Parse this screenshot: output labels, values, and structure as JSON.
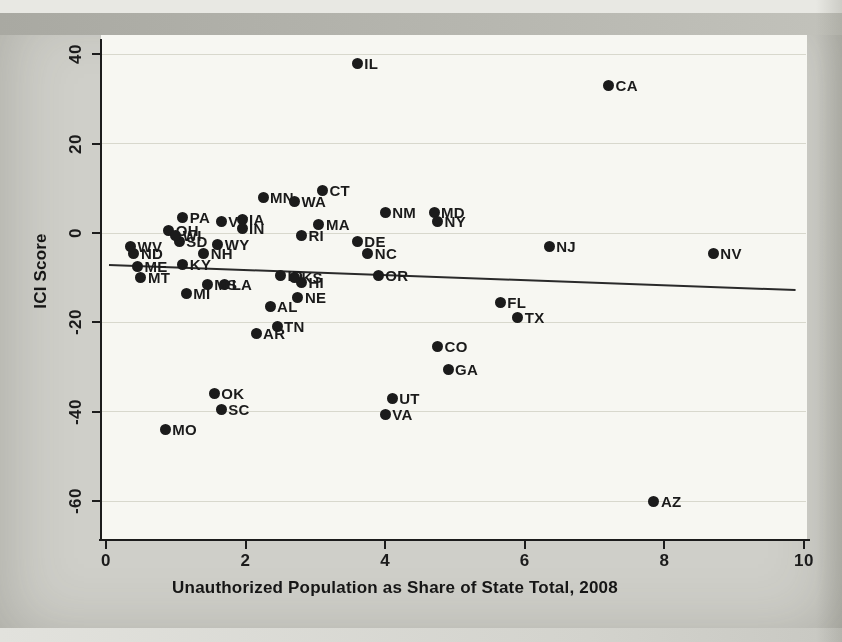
{
  "figure": {
    "kind": "photographed scatter plot figure",
    "title": "",
    "ink_color": "#1b1b1b",
    "page_color": "#cfcfc9",
    "plot_bg_color": "#f7f7f2",
    "gridline_color": "#d8d8cd"
  },
  "chart_data": {
    "type": "scatter",
    "title": "",
    "xlabel": "Unauthorized Population as Share of State Total, 2008",
    "ylabel": "ICI Score",
    "xlim": [
      0,
      10
    ],
    "ylim": [
      -68,
      44
    ],
    "x_ticks": [
      0,
      2,
      4,
      6,
      8,
      10
    ],
    "y_ticks": [
      40,
      20,
      0,
      -20,
      -40,
      -60
    ],
    "grid": "horizontal",
    "legend": "none",
    "marker": "filled-circle",
    "label_position": "right-of-marker",
    "trend_line": {
      "x1": 0,
      "y1": -7.2,
      "x2": 10,
      "y2": -12.8
    },
    "points": [
      {
        "label": "AL",
        "x": 2.35,
        "y": -16.5
      },
      {
        "label": "AR",
        "x": 2.15,
        "y": -22.5
      },
      {
        "label": "AZ",
        "x": 7.85,
        "y": -60
      },
      {
        "label": "CA",
        "x": 7.2,
        "y": 33
      },
      {
        "label": "CO",
        "x": 4.75,
        "y": -25.5
      },
      {
        "label": "CT",
        "x": 3.1,
        "y": 9.5
      },
      {
        "label": "DE",
        "x": 3.6,
        "y": -2
      },
      {
        "label": "FL",
        "x": 5.65,
        "y": -15.5
      },
      {
        "label": "GA",
        "x": 4.9,
        "y": -30.5
      },
      {
        "label": "HI",
        "x": 2.8,
        "y": -11
      },
      {
        "label": "IA",
        "x": 1.95,
        "y": 3
      },
      {
        "label": "ID",
        "x": 2.5,
        "y": -9.5
      },
      {
        "label": "IL",
        "x": 3.6,
        "y": 38
      },
      {
        "label": "IN",
        "x": 1.95,
        "y": 1
      },
      {
        "label": "KS",
        "x": 2.7,
        "y": -10
      },
      {
        "label": "KY",
        "x": 1.1,
        "y": -7
      },
      {
        "label": "LA",
        "x": 1.7,
        "y": -11.5
      },
      {
        "label": "MA",
        "x": 3.05,
        "y": 2
      },
      {
        "label": "MD",
        "x": 4.7,
        "y": 4.5
      },
      {
        "label": "ME",
        "x": 0.45,
        "y": -7.5
      },
      {
        "label": "MI",
        "x": 1.15,
        "y": -13.5
      },
      {
        "label": "MN",
        "x": 2.25,
        "y": 8
      },
      {
        "label": "MO",
        "x": 0.85,
        "y": -44
      },
      {
        "label": "MS",
        "x": 1.45,
        "y": -11.5
      },
      {
        "label": "MT",
        "x": 0.5,
        "y": -10
      },
      {
        "label": "NC",
        "x": 3.75,
        "y": -4.5
      },
      {
        "label": "ND",
        "x": 0.4,
        "y": -4.5
      },
      {
        "label": "NE",
        "x": 2.75,
        "y": -14.5
      },
      {
        "label": "NH",
        "x": 1.4,
        "y": -4.5
      },
      {
        "label": "NJ",
        "x": 6.35,
        "y": -3
      },
      {
        "label": "NM",
        "x": 4.0,
        "y": 4.5
      },
      {
        "label": "NV",
        "x": 8.7,
        "y": -4.5
      },
      {
        "label": "NY",
        "x": 4.75,
        "y": 2.5
      },
      {
        "label": "OH",
        "x": 0.9,
        "y": 0.5
      },
      {
        "label": "OK",
        "x": 1.55,
        "y": -36
      },
      {
        "label": "OR",
        "x": 3.9,
        "y": -9.5
      },
      {
        "label": "PA",
        "x": 1.1,
        "y": 3.5
      },
      {
        "label": "RI",
        "x": 2.8,
        "y": -0.5
      },
      {
        "label": "SC",
        "x": 1.65,
        "y": -39.5
      },
      {
        "label": "SD",
        "x": 1.05,
        "y": -2
      },
      {
        "label": "TN",
        "x": 2.45,
        "y": -21
      },
      {
        "label": "TX",
        "x": 5.9,
        "y": -19
      },
      {
        "label": "UT",
        "x": 4.1,
        "y": -37
      },
      {
        "label": "VA",
        "x": 4.0,
        "y": -40.5
      },
      {
        "label": "VT",
        "x": 1.65,
        "y": 2.5
      },
      {
        "label": "WA",
        "x": 2.7,
        "y": 7
      },
      {
        "label": "WV",
        "x": 0.35,
        "y": -3
      },
      {
        "label": "WI",
        "x": 1.0,
        "y": -0.5
      },
      {
        "label": "WY",
        "x": 1.6,
        "y": -2.5
      }
    ]
  }
}
